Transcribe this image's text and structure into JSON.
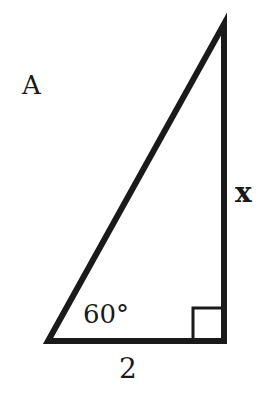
{
  "figure": {
    "label": "A",
    "shape": "right-triangle",
    "angle_label": "60°",
    "base_label": "2",
    "side_label": "x",
    "right_angle_marker": true,
    "stroke_color": "#1a1a1a",
    "background": "#ffffff"
  }
}
